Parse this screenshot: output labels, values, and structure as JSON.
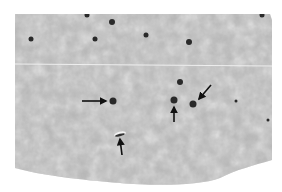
{
  "image": {
    "kind": "grayscale histology micrograph",
    "background_color": "#ffffff",
    "tissue_color": "#b9b9b9",
    "nucleus_color": "#2a2a2a",
    "arrow_color": "#111111",
    "scan_line_color": "#e8e8e8"
  },
  "nuclei": [
    {
      "x": 95,
      "y": 39,
      "r": 2.5
    },
    {
      "x": 87,
      "y": 15,
      "r": 2.5
    },
    {
      "x": 112,
      "y": 22,
      "r": 3
    },
    {
      "x": 146,
      "y": 35,
      "r": 2.5
    },
    {
      "x": 189,
      "y": 42,
      "r": 3
    },
    {
      "x": 262,
      "y": 15,
      "r": 2.5
    },
    {
      "x": 31,
      "y": 39,
      "r": 2.5
    },
    {
      "x": 180,
      "y": 82,
      "r": 3
    },
    {
      "x": 113,
      "y": 101,
      "r": 3.5
    },
    {
      "x": 174,
      "y": 100,
      "r": 3.5
    },
    {
      "x": 193,
      "y": 104,
      "r": 3.5
    },
    {
      "x": 236,
      "y": 101,
      "r": 1.5
    },
    {
      "x": 268,
      "y": 120,
      "r": 1.5
    }
  ],
  "arrows": [
    {
      "x1": 82,
      "y1": 101,
      "x2": 106,
      "y2": 101
    },
    {
      "x1": 174,
      "y1": 122,
      "x2": 174,
      "y2": 107
    },
    {
      "x1": 211,
      "y1": 85,
      "x2": 199,
      "y2": 99
    },
    {
      "x1": 122,
      "y1": 155,
      "x2": 120,
      "y2": 139
    }
  ]
}
